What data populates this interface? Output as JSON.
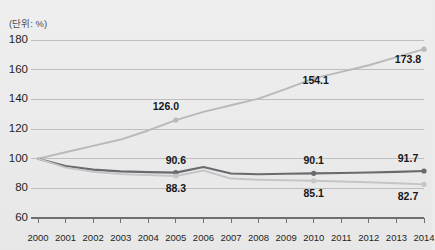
{
  "top_cropped_text": "— —",
  "unit_label": "(단위: %)",
  "colors": {
    "background": "#ececed",
    "gridline": "#b9b9bb",
    "axis": "#6f6f72",
    "series_rising": "#b9b9bb",
    "series_middle": "#6a6a6e",
    "series_lower": "#c5c5c7",
    "label_text": "#161618"
  },
  "chart_data": {
    "type": "line",
    "title": "",
    "subtitle": "",
    "xlabel": "",
    "ylabel": "",
    "unit": "(단위: %)",
    "grid": true,
    "legend_position": "none",
    "ylim": [
      60,
      180
    ],
    "yticks": [
      60,
      80,
      100,
      120,
      140,
      160,
      180
    ],
    "ytick_labels": [
      "60",
      "80",
      "100",
      "120",
      "140",
      "160",
      "180"
    ],
    "x": [
      2000,
      2001,
      2002,
      2003,
      2004,
      2005,
      2006,
      2007,
      2008,
      2009,
      2010,
      2011,
      2012,
      2013,
      2014
    ],
    "xtick_labels": [
      "2000",
      "2001",
      "2002",
      "2003",
      "2004",
      "2005",
      "2006",
      "2007",
      "2008",
      "2009",
      "2010",
      "2011",
      "2012",
      "2013",
      "2014"
    ],
    "series": [
      {
        "name": "series-rising",
        "color": "#b9b9bb",
        "values": [
          100.0,
          104.3,
          108.6,
          112.9,
          119.0,
          126.0,
          131.5,
          136.0,
          140.5,
          147.0,
          154.1,
          158.5,
          163.0,
          168.5,
          173.8
        ],
        "labels": [
          {
            "x": 2005,
            "value": 126.0,
            "text": "126.0"
          },
          {
            "x": 2010,
            "value": 154.1,
            "text": "154.1"
          },
          {
            "x": 2014,
            "value": 173.8,
            "text": "173.8"
          }
        ]
      },
      {
        "name": "series-middle",
        "color": "#6a6a6e",
        "values": [
          100.0,
          95.0,
          92.6,
          91.4,
          90.9,
          90.6,
          94.4,
          90.0,
          89.5,
          89.8,
          90.1,
          90.3,
          90.7,
          91.1,
          91.7
        ],
        "labels": [
          {
            "x": 2005,
            "value": 90.6,
            "text": "90.6"
          },
          {
            "x": 2010,
            "value": 90.1,
            "text": "90.1"
          },
          {
            "x": 2014,
            "value": 91.7,
            "text": "91.7"
          }
        ]
      },
      {
        "name": "series-lower",
        "color": "#c5c5c7",
        "values": [
          100.0,
          94.0,
          91.2,
          89.6,
          88.9,
          88.3,
          92.0,
          86.6,
          85.8,
          85.4,
          85.1,
          84.6,
          84.1,
          83.4,
          82.7
        ],
        "labels": [
          {
            "x": 2005,
            "value": 88.3,
            "text": "88.3"
          },
          {
            "x": 2010,
            "value": 85.1,
            "text": "85.1"
          },
          {
            "x": 2014,
            "value": 82.7,
            "text": "82.7"
          }
        ]
      }
    ]
  }
}
